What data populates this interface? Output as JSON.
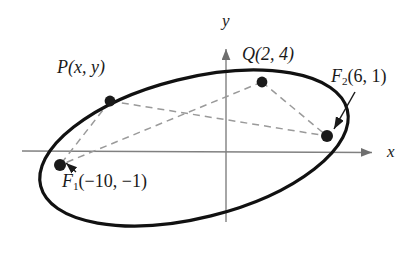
{
  "figure": {
    "type": "geometry-diagram",
    "background_color": "#ffffff"
  },
  "axes": {
    "x_label": "x",
    "y_label": "y",
    "axis_color": "#808080",
    "x_axis": {
      "from_px": [
        22,
        151
      ],
      "to_px": [
        378,
        153
      ]
    },
    "y_axis": {
      "from_px": [
        226,
        43
      ],
      "to_px": [
        226,
        222
      ]
    }
  },
  "curve": {
    "name": "ellipse",
    "color": "#111111",
    "stroke_width": 3,
    "center_px": [
      194,
      148
    ],
    "radius_x_px": 158,
    "radius_y_px": 70,
    "rotation_deg": -14
  },
  "points": [
    {
      "id": "P",
      "label": "P(x, y)",
      "label_math": {
        "name": "P",
        "coords": "(x, y)"
      },
      "dot_px": [
        110,
        101
      ],
      "label_px": [
        57,
        58
      ],
      "on_curve": true
    },
    {
      "id": "Q",
      "label": "Q(2, 4)",
      "label_math": {
        "name": "Q",
        "coords": "(2, 4)"
      },
      "dot_px": [
        262,
        82
      ],
      "label_px": [
        242,
        45
      ],
      "on_curve": true,
      "x_value": 2,
      "y_value": 4
    },
    {
      "id": "F2",
      "label": "F2(6, 1)",
      "label_math": {
        "name": "F",
        "subscript": "2",
        "coords": "(6, 1)"
      },
      "dot_px": [
        327,
        136
      ],
      "label_px": [
        331,
        67
      ],
      "on_curve": false,
      "is_focus": true,
      "x_value": 6,
      "y_value": 1,
      "has_leader_arrow": true
    },
    {
      "id": "F1",
      "label": "F1(-10, -1)",
      "label_math": {
        "name": "F",
        "subscript": "1",
        "coords": "(−10, −1)"
      },
      "dot_px": [
        60,
        165
      ],
      "label_px": [
        62,
        172
      ],
      "on_curve": false,
      "is_focus": true,
      "x_value": -10,
      "y_value": -1,
      "has_leader_arrow": true
    }
  ],
  "connectors": {
    "style": "dashed",
    "color": "#9a9a9a",
    "segments": [
      {
        "id": "P-F1",
        "from": "P",
        "to": "F1"
      },
      {
        "id": "P-F2",
        "from": "P",
        "to": "F2"
      },
      {
        "id": "Q-F1",
        "from": "Q",
        "to": "F1"
      },
      {
        "id": "Q-F2",
        "from": "Q",
        "to": "F2"
      }
    ]
  },
  "colors": {
    "curve": "#111111",
    "axis": "#808080",
    "dashed": "#9a9a9a",
    "dot": "#1a1a1a",
    "text": "#1a1a1a"
  }
}
